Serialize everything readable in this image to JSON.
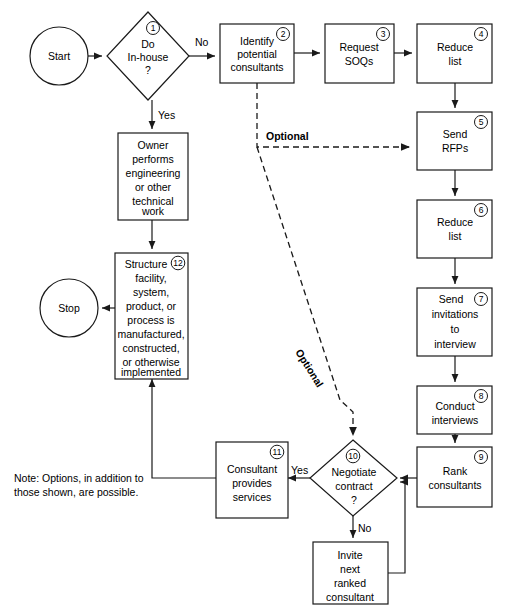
{
  "diagram": {
    "colors": {
      "stroke": "#1a1a1a",
      "fill": "#ffffff",
      "background": "#ffffff"
    },
    "nodes": {
      "start": {
        "label": "Start",
        "shape": "circle"
      },
      "decision1": {
        "label_line1": "Do",
        "label_line2": "In-house",
        "label_line3": "?",
        "badge": "1",
        "shape": "diamond"
      },
      "owner": {
        "label_line1": "Owner",
        "label_line2": "performs",
        "label_line3": "engineering",
        "label_line4": "or other",
        "label_line5": "technical",
        "label_line6": "work",
        "shape": "rect"
      },
      "identify": {
        "label_line1": "Identify",
        "label_line2": "potential",
        "label_line3": "consultants",
        "badge": "2",
        "shape": "rect"
      },
      "request_soqs": {
        "label_line1": "Request",
        "label_line2": "SOQs",
        "badge": "3",
        "shape": "rect"
      },
      "reduce_list_4": {
        "label_line1": "Reduce",
        "label_line2": "list",
        "badge": "4",
        "shape": "rect"
      },
      "send_rfps": {
        "label_line1": "Send",
        "label_line2": "RFPs",
        "badge": "5",
        "shape": "rect"
      },
      "reduce_list_6": {
        "label_line1": "Reduce",
        "label_line2": "list",
        "badge": "6",
        "shape": "rect"
      },
      "send_invitations": {
        "label_line1": "Send",
        "label_line2": "invitations",
        "label_line3": "to",
        "label_line4": "interview",
        "badge": "7",
        "shape": "rect"
      },
      "conduct_interviews": {
        "label_line1": "Conduct",
        "label_line2": "interviews",
        "badge": "8",
        "shape": "rect"
      },
      "rank_consultants": {
        "label_line1": "Rank",
        "label_line2": "consultants",
        "badge": "9",
        "shape": "rect"
      },
      "decision10": {
        "label_line1": "Negotiate",
        "label_line2": "contract",
        "label_line3": "?",
        "badge": "10",
        "shape": "diamond"
      },
      "consultant_services": {
        "label_line1": "Consultant",
        "label_line2": "provides",
        "label_line3": "services",
        "badge": "11",
        "shape": "rect"
      },
      "invite_next": {
        "label_line1": "Invite",
        "label_line2": "next",
        "label_line3": "ranked",
        "label_line4": "consultant",
        "shape": "rect"
      },
      "structure": {
        "label_line1": "Structure",
        "label_line2": "facility,",
        "label_line3": "system,",
        "label_line4": "product, or",
        "label_line5": "process is",
        "label_line6": "manufactured,",
        "label_line7": "constructed,",
        "label_line8": "or otherwise",
        "label_line9": "implemented",
        "badge": "12",
        "shape": "rect"
      },
      "stop": {
        "label": "Stop",
        "shape": "circle"
      }
    },
    "edge_labels": {
      "no_top": "No",
      "yes_top": "Yes",
      "yes_bottom": "Yes",
      "no_bottom": "No",
      "optional_horizontal": "Optional",
      "optional_diagonal": "Optional"
    },
    "note": {
      "line1": "Note: Options, in addition to",
      "line2": "those shown, are possible."
    }
  }
}
